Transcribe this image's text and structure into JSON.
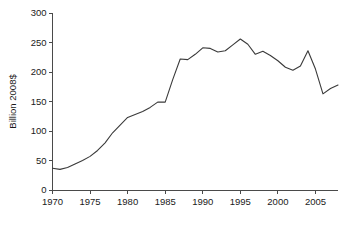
{
  "chart_data": {
    "type": "line",
    "title": "",
    "subtitle": "",
    "xlabel": "",
    "ylabel": "Billion 2008$",
    "xlim": [
      1970,
      2008
    ],
    "ylim": [
      0,
      300
    ],
    "grid": false,
    "legend": "none",
    "x_ticks": [
      1970,
      1975,
      1980,
      1985,
      1990,
      1995,
      2000,
      2005
    ],
    "x_tick_labels": [
      "1970",
      "1975",
      "1980",
      "1985",
      "1990",
      "1995",
      "2000",
      "2005"
    ],
    "y_ticks": [
      0,
      50,
      100,
      150,
      200,
      250,
      300
    ],
    "y_tick_labels": [
      "0",
      "50",
      "100",
      "150",
      "200",
      "250",
      "300"
    ],
    "line_color": "#3a3a3a",
    "series": [
      {
        "name": "Billion 2008$",
        "x": [
          1970,
          1971,
          1972,
          1973,
          1974,
          1975,
          1976,
          1977,
          1978,
          1979,
          1980,
          1981,
          1982,
          1983,
          1984,
          1985,
          1986,
          1987,
          1988,
          1989,
          1990,
          1991,
          1992,
          1993,
          1994,
          1995,
          1996,
          1997,
          1998,
          1999,
          2000,
          2001,
          2002,
          2003,
          2004,
          2005,
          2006,
          2007,
          2008
        ],
        "values": [
          37,
          35,
          38,
          44,
          50,
          57,
          67,
          80,
          97,
          110,
          123,
          128,
          133,
          140,
          149,
          149,
          187,
          222,
          221,
          230,
          241,
          240,
          234,
          236,
          246,
          256,
          247,
          230,
          235,
          228,
          219,
          208,
          203,
          210,
          236,
          205,
          163,
          172,
          178
        ]
      }
    ]
  }
}
